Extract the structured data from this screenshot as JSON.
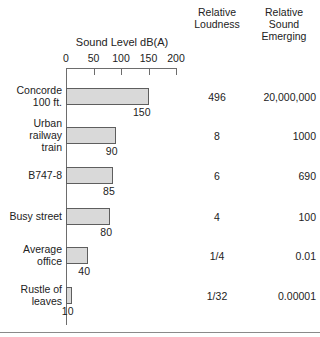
{
  "chart_data": {
    "type": "bar",
    "orientation": "horizontal",
    "title": "",
    "xlabel": "Sound Level dB(A)",
    "ylabel": "",
    "xlim": [
      0,
      200
    ],
    "xticks": [
      0,
      50,
      100,
      150,
      200
    ],
    "grid": false,
    "legend": false,
    "categories": [
      "Concorde 100 ft.",
      "Urban railway train",
      "B747-8",
      "Busy street",
      "Average office",
      "Rustle of leaves"
    ],
    "values": [
      150,
      90,
      85,
      80,
      40,
      10
    ],
    "value_labels": [
      "150",
      "90",
      "85",
      "80",
      "40",
      "10"
    ],
    "series": [
      {
        "name": "Sound Level dB(A)",
        "values": [
          150,
          90,
          85,
          80,
          40,
          10
        ]
      },
      {
        "name": "Relative Loudness",
        "values": [
          "496",
          "8",
          "6",
          "4",
          "1/4",
          "1/32"
        ]
      },
      {
        "name": "Relative Sound Emerging",
        "values": [
          "20,000,000",
          "1000",
          "690",
          "100",
          "0.01",
          "0.00001"
        ]
      }
    ],
    "bar_color": "#d9d9d9",
    "bar_edge_color": "#5e5e5e",
    "axis_color": "#6d6d6d"
  },
  "headers": {
    "axis_title": "Sound Level dB(A)",
    "relative_loudness": "Relative\nLoudness",
    "relative_loudness_line1": "Relative",
    "relative_loudness_line2": "Loudness",
    "relative_emerging_line1": "Relative",
    "relative_emerging_line2": "Sound",
    "relative_emerging_line3": "Emerging"
  },
  "ticks": [
    {
      "label": "0",
      "value": 0
    },
    {
      "label": "50",
      "value": 50
    },
    {
      "label": "100",
      "value": 100
    },
    {
      "label": "150",
      "value": 150
    },
    {
      "label": "200",
      "value": 200
    }
  ],
  "rows": [
    {
      "label_line1": "Concorde",
      "label_line2": "100 ft.",
      "db": 150,
      "db_label": "150",
      "loudness": "496",
      "emerging": "20,000,000"
    },
    {
      "label_line1": "Urban",
      "label_line2": "railway",
      "label_line3": "train",
      "db": 90,
      "db_label": "90",
      "loudness": "8",
      "emerging": "1000"
    },
    {
      "label_line1": "B747-8",
      "db": 85,
      "db_label": "85",
      "loudness": "6",
      "emerging": "690"
    },
    {
      "label_line1": "Busy street",
      "db": 80,
      "db_label": "80",
      "loudness": "4",
      "emerging": "100"
    },
    {
      "label_line1": "Average",
      "label_line2": "office",
      "db": 40,
      "db_label": "40",
      "loudness": "1/4",
      "emerging": "0.01"
    },
    {
      "label_line1": "Rustle of",
      "label_line2": "leaves",
      "db": 10,
      "db_label": "10",
      "loudness": "1/32",
      "emerging": "0.00001"
    }
  ]
}
